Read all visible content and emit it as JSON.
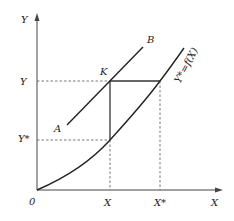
{
  "diagram": {
    "axes": {
      "y_label": "Y",
      "x_label": "X",
      "origin_label": "0"
    },
    "ticks": {
      "y_upper": "Y",
      "y_lower": "Y*",
      "x_left": "X",
      "x_right": "X*"
    },
    "lines": {
      "ab_start_label": "A",
      "ab_end_label": "B",
      "point_label": "K",
      "curve_label": "Y*=f(X)"
    },
    "colors": {
      "line": "#222222",
      "dashed": "#555555",
      "background": "#ffffff"
    }
  }
}
